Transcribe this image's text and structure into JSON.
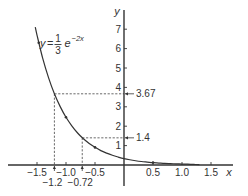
{
  "chart_data": {
    "type": "line",
    "title": "",
    "xlabel": "x",
    "ylabel": "y",
    "xlim": [
      -1.65,
      1.8
    ],
    "ylim": [
      -1.1,
      8.0
    ],
    "grid": false,
    "legend": null,
    "function_label": {
      "lhs": "y",
      "equals": "=",
      "numerator": "1",
      "denominator": "3",
      "base": "e",
      "exponent": "−2x"
    },
    "x_ticks": [
      {
        "value": -1.5,
        "label": "−1.5"
      },
      {
        "value": -1.0,
        "label": "−1.0"
      },
      {
        "value": -0.5,
        "label": "−0.5"
      },
      {
        "value": 0.5,
        "label": "0.5"
      },
      {
        "value": 1.0,
        "label": "1.0"
      },
      {
        "value": 1.5,
        "label": "1.5"
      }
    ],
    "y_ticks": [
      {
        "value": 1,
        "label": "1"
      },
      {
        "value": 2,
        "label": "2"
      },
      {
        "value": 3,
        "label": "3"
      },
      {
        "value": 4,
        "label": "4"
      },
      {
        "value": 5,
        "label": "5"
      },
      {
        "value": 6,
        "label": "6"
      },
      {
        "value": 7,
        "label": "7"
      }
    ],
    "series": [
      {
        "name": "y = (1/3)e^(−2x)",
        "x": [
          -1.53,
          -1.5,
          -1.4,
          -1.3,
          -1.2,
          -1.1,
          -1.0,
          -0.9,
          -0.8,
          -0.7,
          -0.6,
          -0.5,
          -0.4,
          -0.3,
          -0.2,
          -0.1,
          0,
          0.1,
          0.2,
          0.3,
          0.4,
          0.5,
          0.6,
          0.7,
          0.8,
          0.9,
          1.0,
          1.1,
          1.2,
          1.3
        ],
        "y": [
          7.11,
          6.7,
          5.48,
          4.49,
          3.67,
          3.01,
          2.46,
          2.02,
          1.65,
          1.35,
          1.11,
          0.91,
          0.74,
          0.61,
          0.5,
          0.41,
          0.33,
          0.27,
          0.22,
          0.18,
          0.15,
          0.12,
          0.1,
          0.08,
          0.07,
          0.06,
          0.05,
          0.04,
          0.03,
          0.02
        ]
      }
    ],
    "curve_markers_x": [
      -1.47,
      -1.0,
      -0.5,
      0.5
    ],
    "annotations": [
      {
        "x": -1.2,
        "y": 3.67,
        "x_label": "−1.2",
        "y_label": "3.67"
      },
      {
        "x": -0.72,
        "y": 1.4,
        "x_label": "−0.72",
        "y_label": "1.4"
      }
    ],
    "colors": {
      "line": "#333333",
      "dashed": "#444444",
      "text": "#333333",
      "background": "#ffffff"
    }
  }
}
